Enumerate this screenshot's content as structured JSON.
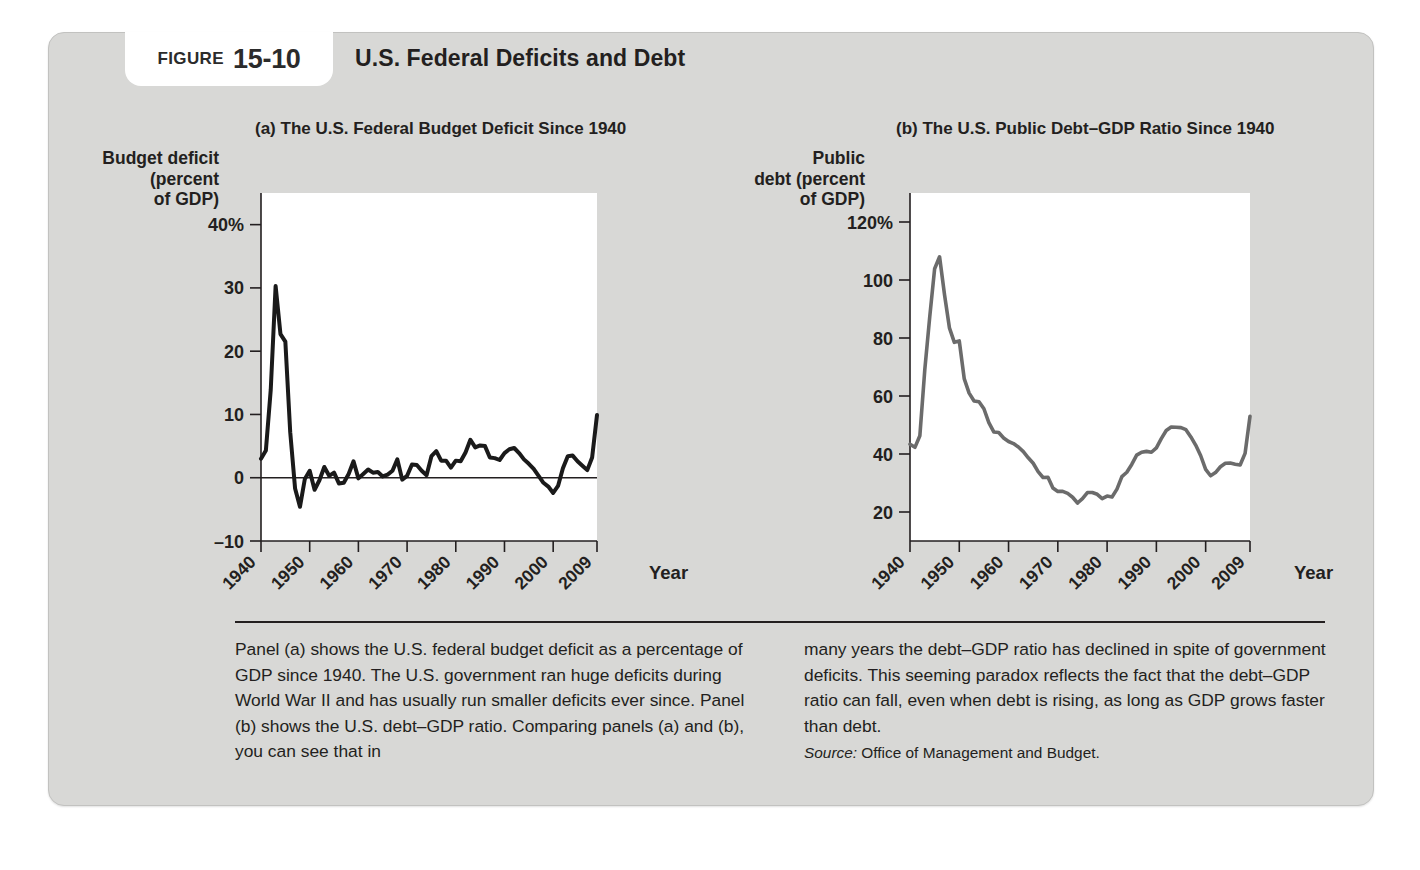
{
  "figure": {
    "tab_word": "Figure",
    "number": "15-10",
    "title": "U.S. Federal Deficits and Debt"
  },
  "panel_a": {
    "subtitle": "(a) The U.S. Federal Budget Deficit Since 1940",
    "y_axis_title": "Budget deficit\n(percent\nof GDP)",
    "x_axis_title": "Year"
  },
  "panel_b": {
    "subtitle": "(b) The U.S. Public Debt–GDP Ratio Since 1940",
    "y_axis_title": "Public\ndebt (percent\nof GDP)",
    "x_axis_title": "Year"
  },
  "caption": {
    "left_column": "Panel (a) shows the U.S. federal budget deficit as a percentage of GDP since 1940. The U.S. government ran huge deficits during World War II and has usually run smaller deficits ever since. Panel (b) shows the U.S. debt–GDP ratio. Comparing panels (a) and (b), you can see that in",
    "right_column": "many years the debt–GDP ratio has declined in spite of government deficits. This seeming paradox reflects the fact that the debt–GDP ratio can fall, even when debt is rising, as long as GDP grows faster than debt.",
    "source_label": "Source:",
    "source_text": "Office of Management and Budget."
  },
  "colors": {
    "panel_background": "#d8d8d6",
    "plot_background": "#ffffff",
    "text": "#231f20",
    "line_a": "#1a1a1a",
    "line_b": "#6b6b6b",
    "axis": "#231f20"
  },
  "chart_data": [
    {
      "type": "line",
      "title": "(a) The U.S. Federal Budget Deficit Since 1940",
      "xlabel": "Year",
      "ylabel": "Budget deficit (percent of GDP)",
      "xlim": [
        1940,
        2009
      ],
      "ylim": [
        -10,
        45
      ],
      "grid": false,
      "legend": "none",
      "y_ticks": [
        -10,
        0,
        10,
        20,
        30,
        40
      ],
      "y_tick_labels": [
        "–10",
        "0",
        "10",
        "20",
        "30",
        "40%"
      ],
      "x_ticks": [
        1940,
        1950,
        1960,
        1970,
        1980,
        1990,
        2000,
        2009
      ],
      "x_tick_labels": [
        "1940",
        "1950",
        "1960",
        "1970",
        "1980",
        "1990",
        "2000",
        "2009"
      ],
      "zero_line": 0,
      "series": [
        {
          "name": "Federal budget deficit (percent of GDP)",
          "x": [
            1940,
            1941,
            1942,
            1943,
            1944,
            1945,
            1946,
            1947,
            1948,
            1949,
            1950,
            1951,
            1952,
            1953,
            1954,
            1955,
            1956,
            1957,
            1958,
            1959,
            1960,
            1961,
            1962,
            1963,
            1964,
            1965,
            1966,
            1967,
            1968,
            1969,
            1970,
            1971,
            1972,
            1973,
            1974,
            1975,
            1976,
            1977,
            1978,
            1979,
            1980,
            1981,
            1982,
            1983,
            1984,
            1985,
            1986,
            1987,
            1988,
            1989,
            1990,
            1991,
            1992,
            1993,
            1994,
            1995,
            1996,
            1997,
            1998,
            1999,
            2000,
            2001,
            2002,
            2003,
            2004,
            2005,
            2006,
            2007,
            2008,
            2009
          ],
          "values": [
            3.0,
            4.3,
            13.9,
            30.3,
            22.7,
            21.5,
            7.2,
            -1.7,
            -4.6,
            -0.2,
            1.1,
            -1.9,
            -0.4,
            1.7,
            0.3,
            0.8,
            -0.9,
            -0.8,
            0.6,
            2.6,
            -0.1,
            0.6,
            1.3,
            0.8,
            0.9,
            0.2,
            0.5,
            1.1,
            2.9,
            -0.3,
            0.3,
            2.1,
            2.0,
            1.1,
            0.4,
            3.4,
            4.2,
            2.7,
            2.7,
            1.6,
            2.7,
            2.6,
            4.0,
            6.0,
            4.8,
            5.1,
            5.0,
            3.2,
            3.1,
            2.8,
            3.9,
            4.5,
            4.7,
            3.9,
            2.9,
            2.2,
            1.4,
            0.3,
            -0.8,
            -1.4,
            -2.4,
            -1.3,
            1.5,
            3.4,
            3.5,
            2.6,
            1.9,
            1.2,
            3.2,
            9.9
          ]
        }
      ]
    },
    {
      "type": "line",
      "title": "(b) The U.S. Public Debt–GDP Ratio Since 1940",
      "xlabel": "Year",
      "ylabel": "Public debt (percent of GDP)",
      "xlim": [
        1940,
        2009
      ],
      "ylim": [
        10,
        130
      ],
      "grid": false,
      "legend": "none",
      "y_ticks": [
        20,
        40,
        60,
        80,
        100,
        120
      ],
      "y_tick_labels": [
        "20",
        "40",
        "60",
        "80",
        "100",
        "120%"
      ],
      "x_ticks": [
        1940,
        1950,
        1960,
        1970,
        1980,
        1990,
        2000,
        2009
      ],
      "x_tick_labels": [
        "1940",
        "1950",
        "1960",
        "1970",
        "1980",
        "1990",
        "2000",
        "2009"
      ],
      "series": [
        {
          "name": "Public debt (percent of GDP)",
          "x": [
            1940,
            1941,
            1942,
            1943,
            1944,
            1945,
            1946,
            1947,
            1948,
            1949,
            1950,
            1951,
            1952,
            1953,
            1954,
            1955,
            1956,
            1957,
            1958,
            1959,
            1960,
            1961,
            1962,
            1963,
            1964,
            1965,
            1966,
            1967,
            1968,
            1969,
            1970,
            1971,
            1972,
            1973,
            1974,
            1975,
            1976,
            1977,
            1978,
            1979,
            1980,
            1981,
            1982,
            1983,
            1984,
            1985,
            1986,
            1987,
            1988,
            1989,
            1990,
            1991,
            1992,
            1993,
            1994,
            1995,
            1996,
            1997,
            1998,
            1999,
            2000,
            2001,
            2002,
            2003,
            2004,
            2005,
            2006,
            2007,
            2008,
            2009
          ],
          "values": [
            43.4,
            42.3,
            46.3,
            69.0,
            87.2,
            103.9,
            108.0,
            95.0,
            83.5,
            78.5,
            79.0,
            66.0,
            61.0,
            58.3,
            58.0,
            55.6,
            50.8,
            47.6,
            47.4,
            45.5,
            44.3,
            43.6,
            42.4,
            40.8,
            38.7,
            36.8,
            33.9,
            31.9,
            32.0,
            28.3,
            27.1,
            27.1,
            26.4,
            25.1,
            23.1,
            24.6,
            26.7,
            26.7,
            26.1,
            24.6,
            25.5,
            25.2,
            27.9,
            32.2,
            33.7,
            36.4,
            39.6,
            40.6,
            40.9,
            40.6,
            42.1,
            45.3,
            48.1,
            49.3,
            49.2,
            49.1,
            48.4,
            45.9,
            43.0,
            39.4,
            34.7,
            32.5,
            33.6,
            35.6,
            36.8,
            36.9,
            36.5,
            36.2,
            40.2,
            53.0
          ]
        }
      ]
    }
  ]
}
